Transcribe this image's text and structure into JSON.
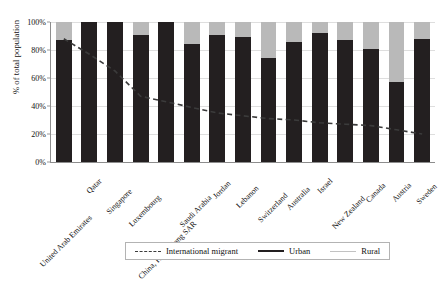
{
  "chart_data": {
    "type": "bar",
    "title": "",
    "xlabel": "",
    "ylabel": "% of total population",
    "ylim": [
      0,
      100
    ],
    "ytick_labels": [
      "0%",
      "20%",
      "40%",
      "60%",
      "80%",
      "100%"
    ],
    "ytick_values": [
      0,
      20,
      40,
      60,
      80,
      100
    ],
    "grid": true,
    "legend_position": "bottom",
    "stacked": true,
    "categories": [
      "United Arab Emirates",
      "Qatar",
      "Singapore",
      "Luxembourg",
      "China, Hong Kong SAR",
      "Saudi Arabia",
      "Jordan",
      "Lebanon",
      "Switzerland",
      "Australia",
      "Israel",
      "New Zealand",
      "Canada",
      "Austria",
      "Sweden"
    ],
    "series": [
      {
        "name": "Urban",
        "type": "bar",
        "color": "#231f20",
        "values": [
          87,
          100,
          100,
          91,
          100,
          84,
          91,
          89,
          74,
          86,
          92,
          87,
          81,
          57,
          88
        ]
      },
      {
        "name": "Rural",
        "type": "bar",
        "color": "#b9b9b9",
        "values": [
          13,
          0,
          0,
          9,
          0,
          16,
          9,
          11,
          26,
          14,
          8,
          13,
          19,
          43,
          12
        ]
      },
      {
        "name": "International migrant",
        "type": "line",
        "style": "dashed",
        "color": "#3b3b3b",
        "values": [
          88,
          77,
          65,
          47,
          43,
          39,
          35,
          33,
          31,
          30,
          28,
          27,
          26,
          23,
          20
        ]
      }
    ]
  },
  "legend": {
    "items": [
      {
        "label": "International migrant",
        "swatch": "dashed-line-swatch"
      },
      {
        "label": "Urban",
        "swatch": "solid-black-line-swatch"
      },
      {
        "label": "Rural",
        "swatch": "solid-gray-line-swatch"
      }
    ]
  }
}
